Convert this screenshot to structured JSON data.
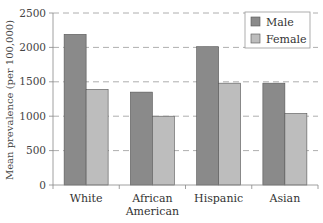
{
  "chart_data": {
    "type": "bar",
    "title": "",
    "xlabel": "",
    "ylabel": "Mean prevalence (per 100,000)",
    "categories": [
      "White",
      "African American",
      "Hispanic",
      "Asian"
    ],
    "category_lines": [
      [
        "White"
      ],
      [
        "African",
        "American"
      ],
      [
        "Hispanic"
      ],
      [
        "Asian"
      ]
    ],
    "series": [
      {
        "name": "Male",
        "color": "#8a8a8a",
        "values": [
          2190,
          1350,
          2010,
          1480
        ]
      },
      {
        "name": "Female",
        "color": "#bdbdbd",
        "values": [
          1390,
          1000,
          1480,
          1040
        ]
      }
    ],
    "ylim": [
      0,
      2500
    ],
    "yticks": [
      0,
      500,
      1000,
      1500,
      2000,
      2500
    ],
    "grid": "horizontal dashed",
    "legend_position": "upper right"
  },
  "legend": {
    "items": [
      {
        "label": "Male"
      },
      {
        "label": "Female"
      }
    ]
  }
}
